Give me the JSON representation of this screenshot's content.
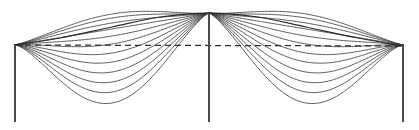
{
  "figure": {
    "width": 419,
    "height": 130,
    "background_color": "#ffffff",
    "line_color": "#3c3c3c",
    "accent_color": "#2b2b2b",
    "support_color": "#4a4a4a"
  },
  "geometry": {
    "supports_x": [
      15,
      209,
      403
    ],
    "support_top_y": 45,
    "support_bottom_y": 122,
    "datum_y": 45,
    "crest_y": 13,
    "deepest_sag_y": 103,
    "bay_count": 2,
    "curves_per_bay": 13,
    "crossover_x_left": 112,
    "crossover_x_right": 306
  },
  "chart_data": {
    "type": "line",
    "subtitle": "",
    "xlabel": "",
    "ylabel": "",
    "xlim": [
      0,
      419
    ],
    "ylim": [
      130,
      0
    ],
    "grid": false,
    "legend": null,
    "annotations": [],
    "x_tick_labels": [],
    "y_tick_labels": [],
    "series": [
      {
        "name": "support-left",
        "style": "solid",
        "points": [
          [
            15,
            45
          ],
          [
            15,
            122
          ]
        ]
      },
      {
        "name": "support-center",
        "style": "solid",
        "points": [
          [
            209,
            13
          ],
          [
            209,
            122
          ]
        ]
      },
      {
        "name": "support-right",
        "style": "solid",
        "points": [
          [
            403,
            45
          ],
          [
            403,
            122
          ]
        ]
      },
      {
        "name": "datum-line-dashed",
        "style": "dashed",
        "points": [
          [
            15,
            45
          ],
          [
            403,
            46
          ]
        ]
      },
      {
        "name": "envelope-crest",
        "style": "solid",
        "description": "upper envelope arching from left support over center to right support",
        "points": [
          [
            15,
            45
          ],
          [
            60,
            38
          ],
          [
            112,
            27
          ],
          [
            160,
            17
          ],
          [
            209,
            13
          ],
          [
            258,
            17
          ],
          [
            306,
            27
          ],
          [
            358,
            38
          ],
          [
            403,
            46
          ]
        ]
      },
      {
        "name": "mode-bay1-01",
        "style": "dashed-then-solid",
        "sag_depth": 2,
        "points": [
          [
            15,
            45
          ],
          [
            112,
            14
          ],
          [
            209,
            13
          ]
        ]
      },
      {
        "name": "mode-bay1-02",
        "style": "dashed-then-solid",
        "sag_depth": 5,
        "points": [
          [
            15,
            45
          ],
          [
            112,
            18
          ],
          [
            209,
            13
          ]
        ]
      },
      {
        "name": "mode-bay1-03",
        "style": "dashed-then-solid",
        "sag_depth": 9,
        "points": [
          [
            15,
            45
          ],
          [
            112,
            23
          ],
          [
            209,
            13
          ]
        ]
      },
      {
        "name": "mode-bay1-04",
        "style": "dashed-then-solid",
        "sag_depth": 14,
        "points": [
          [
            15,
            45
          ],
          [
            112,
            29
          ],
          [
            209,
            13
          ]
        ]
      },
      {
        "name": "mode-bay1-05",
        "style": "dashed-then-solid",
        "sag_depth": 20,
        "points": [
          [
            15,
            45
          ],
          [
            112,
            36
          ],
          [
            209,
            13
          ]
        ]
      },
      {
        "name": "mode-bay1-06",
        "style": "solid",
        "sag_depth": 27,
        "points": [
          [
            15,
            45
          ],
          [
            112,
            44
          ],
          [
            209,
            13
          ]
        ]
      },
      {
        "name": "mode-bay1-07",
        "style": "solid",
        "sag_depth": 35,
        "points": [
          [
            15,
            45
          ],
          [
            112,
            53
          ],
          [
            209,
            13
          ]
        ]
      },
      {
        "name": "mode-bay1-08",
        "style": "solid",
        "sag_depth": 43,
        "points": [
          [
            15,
            45
          ],
          [
            112,
            62
          ],
          [
            209,
            13
          ]
        ]
      },
      {
        "name": "mode-bay1-09",
        "style": "solid",
        "sag_depth": 52,
        "points": [
          [
            15,
            45
          ],
          [
            112,
            72
          ],
          [
            209,
            13
          ]
        ]
      },
      {
        "name": "mode-bay1-10",
        "style": "solid",
        "sag_depth": 62,
        "points": [
          [
            15,
            45
          ],
          [
            112,
            82
          ],
          [
            209,
            13
          ]
        ]
      },
      {
        "name": "mode-bay1-11",
        "style": "solid",
        "sag_depth": 72,
        "points": [
          [
            15,
            45
          ],
          [
            112,
            92
          ],
          [
            209,
            13
          ]
        ]
      },
      {
        "name": "mode-bay1-12",
        "style": "solid",
        "sag_depth": 82,
        "points": [
          [
            15,
            45
          ],
          [
            112,
            103
          ],
          [
            209,
            13
          ]
        ]
      },
      {
        "name": "mode-bay2-01",
        "style": "solid-then-dashed",
        "sag_depth": 2,
        "points": [
          [
            209,
            13
          ],
          [
            306,
            14
          ],
          [
            403,
            45
          ]
        ]
      },
      {
        "name": "mode-bay2-02",
        "style": "solid-then-dashed",
        "sag_depth": 5,
        "points": [
          [
            209,
            13
          ],
          [
            306,
            18
          ],
          [
            403,
            45
          ]
        ]
      },
      {
        "name": "mode-bay2-03",
        "style": "solid-then-dashed",
        "sag_depth": 9,
        "points": [
          [
            209,
            13
          ],
          [
            306,
            23
          ],
          [
            403,
            45
          ]
        ]
      },
      {
        "name": "mode-bay2-04",
        "style": "solid-then-dashed",
        "sag_depth": 14,
        "points": [
          [
            209,
            13
          ],
          [
            306,
            29
          ],
          [
            403,
            45
          ]
        ]
      },
      {
        "name": "mode-bay2-05",
        "style": "solid-then-dashed",
        "sag_depth": 20,
        "points": [
          [
            209,
            13
          ],
          [
            306,
            36
          ],
          [
            403,
            45
          ]
        ]
      },
      {
        "name": "mode-bay2-06",
        "style": "solid",
        "sag_depth": 27,
        "points": [
          [
            209,
            13
          ],
          [
            306,
            44
          ],
          [
            403,
            45
          ]
        ]
      },
      {
        "name": "mode-bay2-07",
        "style": "solid",
        "sag_depth": 35,
        "points": [
          [
            209,
            13
          ],
          [
            306,
            53
          ],
          [
            403,
            45
          ]
        ]
      },
      {
        "name": "mode-bay2-08",
        "style": "solid",
        "sag_depth": 43,
        "points": [
          [
            209,
            13
          ],
          [
            306,
            62
          ],
          [
            403,
            45
          ]
        ]
      },
      {
        "name": "mode-bay2-09",
        "style": "solid",
        "sag_depth": 52,
        "points": [
          [
            209,
            13
          ],
          [
            306,
            72
          ],
          [
            403,
            45
          ]
        ]
      },
      {
        "name": "mode-bay2-10",
        "style": "solid",
        "sag_depth": 62,
        "points": [
          [
            209,
            13
          ],
          [
            306,
            82
          ],
          [
            403,
            45
          ]
        ]
      },
      {
        "name": "mode-bay2-11",
        "style": "solid",
        "sag_depth": 72,
        "points": [
          [
            209,
            13
          ],
          [
            306,
            92
          ],
          [
            403,
            45
          ]
        ]
      },
      {
        "name": "mode-bay2-12",
        "style": "solid",
        "sag_depth": 82,
        "points": [
          [
            209,
            13
          ],
          [
            306,
            103
          ],
          [
            403,
            45
          ]
        ]
      }
    ]
  }
}
